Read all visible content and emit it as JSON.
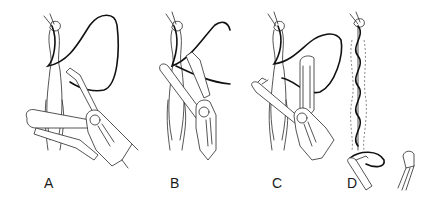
{
  "figure": {
    "type": "surgical-technique-illustration",
    "panels": [
      {
        "id": "A",
        "label": "A",
        "description": "Suture loop passed around tissue with forceps grasping needle"
      },
      {
        "id": "B",
        "label": "B",
        "description": "Needle holder crossing to draw suture through tissue"
      },
      {
        "id": "C",
        "label": "C",
        "description": "Second instrument pulling suture tag with loop above"
      },
      {
        "id": "D",
        "label": "D",
        "description": "Completed running spiral suture along tissue with instrument tips below"
      }
    ],
    "colors": {
      "background": "#ffffff",
      "line": "#2a2a2a",
      "suture": "#111111",
      "label": "#1a1a1a"
    }
  }
}
